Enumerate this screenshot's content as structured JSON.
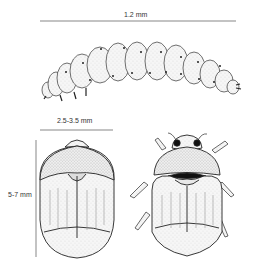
{
  "figure": {
    "larva": {
      "measurement_label": "1.2 mm"
    },
    "adult_dorsal": {
      "width_label": "2.5-3.5 mm",
      "length_label": "5-7 mm"
    },
    "adult_ventral": {}
  },
  "colors": {
    "ink": "#333333",
    "body_fill": "#f4f4f4",
    "shade": "#bbbbbb",
    "dark": "#111111"
  }
}
